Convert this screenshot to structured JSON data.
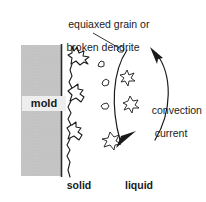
{
  "diagram": {
    "title_caption": {
      "line1": "equiaxed grain or",
      "line2": "broken dendrite"
    },
    "mold_label": "mold",
    "convection_label": {
      "line1": "convection",
      "line2": "current"
    },
    "phase_labels": {
      "solid": "solid",
      "liquid": "liquid"
    },
    "colors": {
      "mold_fill": "#c8c8c8",
      "mold_border": "#333333",
      "stroke": "#1a1a1a",
      "background": "#ffffff",
      "label_backdrop": "#eeeeee"
    },
    "elements": {
      "mold_block": "hatched-grey-rectangle",
      "columnar_dendrites": "jagged-solidification-front",
      "equiaxed_grains": "small-star-polygons",
      "convection_arrows": "two-curved-arcs-with-arrowheads",
      "leader_line": "pointer-from-caption-to-grain"
    }
  }
}
